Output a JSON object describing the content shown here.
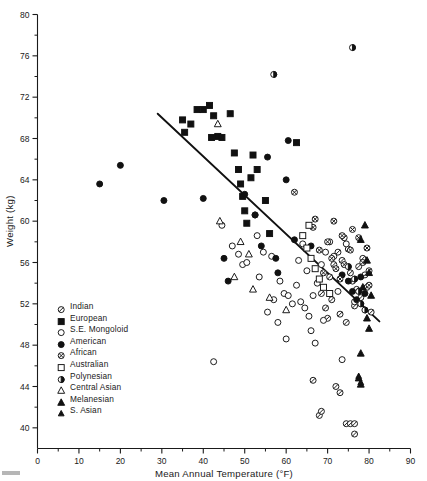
{
  "figure": {
    "title": "",
    "x_axis_title": "Mean Annual Temperature (°F)",
    "y_axis_title": "Weight (kg)"
  },
  "axes": {
    "x_ticks": [
      "0",
      "10",
      "20",
      "30",
      "40",
      "50",
      "60",
      "70",
      "80",
      "90"
    ],
    "y_ticks": [
      "40",
      "44",
      "48",
      "52",
      "56",
      "60",
      "64",
      "68",
      "72",
      "76",
      "80"
    ]
  },
  "legend": {
    "items": [
      {
        "label": "Indian",
        "marker": "circle-slashed"
      },
      {
        "label": "European",
        "marker": "square-filled"
      },
      {
        "label": "S.E. Mongoloid",
        "marker": "circle-open"
      },
      {
        "label": "American",
        "marker": "circle-filled"
      },
      {
        "label": "African",
        "marker": "circle-crossed"
      },
      {
        "label": "Australian",
        "marker": "square-open"
      },
      {
        "label": "Polynesian",
        "marker": "circle-halffilled"
      },
      {
        "label": "Central Asian",
        "marker": "triangle-open"
      },
      {
        "label": "Melanesian",
        "marker": "triangle-filled"
      },
      {
        "label": "S. Asian",
        "marker": "triangle-small-filled"
      }
    ]
  },
  "chart_data": {
    "type": "scatter",
    "title": "",
    "xlabel": "Mean Annual Temperature (°F)",
    "ylabel": "Weight (kg)",
    "xlim": [
      0,
      90
    ],
    "ylim": [
      38,
      80
    ],
    "xticks": [
      0,
      10,
      20,
      30,
      40,
      50,
      60,
      70,
      80,
      90
    ],
    "yticks": [
      40,
      44,
      48,
      52,
      56,
      60,
      64,
      68,
      72,
      76,
      80
    ],
    "x_minor_step": 5,
    "y_minor_step": 2,
    "grid": false,
    "legend_position": "inside-lower-left",
    "trendline": {
      "label": "regression line",
      "x_start": 29.0,
      "y_start": 70.4,
      "x_end": 82.5,
      "y_end": 50.3
    },
    "series": [
      {
        "name": "Indian",
        "marker": "circle-slashed",
        "points": [
          [
            70.5,
            54.6
          ],
          [
            71.5,
            55.8
          ],
          [
            72.5,
            57.0
          ],
          [
            73.5,
            56.2
          ],
          [
            74.0,
            58.4
          ],
          [
            75.0,
            57.3
          ],
          [
            75.5,
            55.0
          ],
          [
            76.0,
            54.2
          ],
          [
            77.0,
            53.4
          ],
          [
            77.5,
            55.6
          ],
          [
            78.5,
            56.4
          ],
          [
            79.0,
            54.8
          ],
          [
            68.5,
            53.0
          ],
          [
            69.5,
            51.6
          ],
          [
            70.0,
            50.6
          ],
          [
            71.0,
            52.4
          ],
          [
            73.0,
            51.0
          ],
          [
            74.5,
            50.2
          ],
          [
            76.5,
            51.8
          ],
          [
            78.0,
            52.6
          ],
          [
            79.5,
            53.6
          ],
          [
            80.0,
            55.2
          ],
          [
            68.0,
            41.2
          ],
          [
            68.5,
            41.6
          ],
          [
            74.5,
            40.4
          ],
          [
            75.5,
            40.4
          ],
          [
            76.5,
            40.4
          ],
          [
            76.5,
            39.4
          ],
          [
            72.0,
            44.0
          ],
          [
            73.0,
            43.4
          ],
          [
            80.5,
            51.2
          ],
          [
            66.5,
            44.6
          ]
        ]
      },
      {
        "name": "European",
        "marker": "square-filled",
        "points": [
          [
            35.0,
            69.8
          ],
          [
            35.5,
            68.6
          ],
          [
            38.5,
            70.8
          ],
          [
            40.0,
            70.8
          ],
          [
            41.5,
            71.2
          ],
          [
            42.5,
            70.2
          ],
          [
            43.5,
            68.2
          ],
          [
            37.0,
            69.4
          ],
          [
            42.0,
            68.1
          ],
          [
            44.5,
            68.1
          ],
          [
            46.5,
            70.4
          ],
          [
            47.5,
            66.6
          ],
          [
            48.5,
            65.0
          ],
          [
            49.0,
            63.6
          ],
          [
            49.5,
            62.4
          ],
          [
            50.0,
            61.0
          ],
          [
            51.5,
            64.2
          ],
          [
            52.0,
            66.4
          ],
          [
            53.0,
            65.0
          ],
          [
            55.0,
            62.0
          ],
          [
            56.0,
            58.8
          ],
          [
            62.5,
            67.6
          ],
          [
            50.5,
            59.8
          ]
        ]
      },
      {
        "name": "S.E. Mongoloid",
        "marker": "circle-open",
        "points": [
          [
            44.5,
            59.6
          ],
          [
            47.0,
            57.6
          ],
          [
            48.5,
            56.8
          ],
          [
            49.5,
            55.8
          ],
          [
            50.5,
            56.0
          ],
          [
            53.0,
            58.6
          ],
          [
            54.5,
            57.0
          ],
          [
            56.5,
            56.6
          ],
          [
            58.5,
            54.2
          ],
          [
            59.5,
            53.0
          ],
          [
            60.5,
            52.8
          ],
          [
            61.5,
            52.0
          ],
          [
            62.5,
            53.8
          ],
          [
            63.5,
            52.2
          ],
          [
            64.5,
            51.6
          ],
          [
            65.5,
            50.8
          ],
          [
            66.5,
            52.8
          ],
          [
            67.5,
            54.0
          ],
          [
            68.5,
            55.8
          ],
          [
            69.5,
            57.0
          ],
          [
            70.5,
            58.0
          ],
          [
            71.5,
            56.6
          ],
          [
            72.5,
            53.2
          ],
          [
            66.0,
            49.4
          ],
          [
            67.0,
            48.2
          ],
          [
            69.0,
            50.4
          ],
          [
            55.5,
            51.2
          ],
          [
            57.0,
            52.4
          ],
          [
            42.5,
            46.4
          ],
          [
            53.5,
            54.6
          ],
          [
            63.0,
            56.2
          ],
          [
            64.0,
            57.8
          ],
          [
            74.5,
            57.8
          ],
          [
            76.5,
            52.2
          ],
          [
            58.0,
            50.2
          ],
          [
            60.0,
            48.6
          ],
          [
            52.5,
            60.6
          ],
          [
            65.0,
            55.2
          ],
          [
            73.5,
            46.6
          ]
        ]
      },
      {
        "name": "American",
        "marker": "circle-filled",
        "points": [
          [
            15.0,
            63.6
          ],
          [
            20.0,
            65.4
          ],
          [
            30.5,
            62.0
          ],
          [
            40.0,
            62.2
          ],
          [
            45.0,
            56.4
          ],
          [
            46.0,
            54.2
          ],
          [
            50.0,
            62.6
          ],
          [
            52.5,
            60.6
          ],
          [
            55.5,
            66.2
          ],
          [
            57.5,
            56.4
          ],
          [
            60.0,
            64.0
          ],
          [
            60.5,
            67.8
          ],
          [
            62.0,
            58.2
          ],
          [
            66.0,
            57.6
          ],
          [
            73.5,
            54.8
          ],
          [
            75.0,
            54.2
          ],
          [
            76.0,
            53.2
          ],
          [
            77.0,
            52.4
          ],
          [
            78.0,
            54.6
          ],
          [
            79.0,
            53.0
          ],
          [
            54.0,
            57.6
          ],
          [
            58.0,
            55.0
          ]
        ]
      },
      {
        "name": "African",
        "marker": "circle-crossed",
        "points": [
          [
            62.0,
            62.8
          ],
          [
            66.5,
            59.4
          ],
          [
            70.0,
            58.0
          ],
          [
            71.0,
            56.4
          ],
          [
            72.0,
            55.4
          ],
          [
            73.0,
            54.4
          ],
          [
            74.0,
            55.8
          ],
          [
            75.5,
            57.2
          ],
          [
            77.5,
            58.4
          ],
          [
            78.5,
            56.0
          ],
          [
            80.0,
            53.8
          ],
          [
            68.0,
            57.2
          ],
          [
            69.0,
            55.0
          ],
          [
            76.0,
            59.2
          ],
          [
            79.5,
            57.4
          ],
          [
            67.0,
            60.2
          ],
          [
            71.5,
            60.0
          ],
          [
            73.5,
            58.6
          ]
        ]
      },
      {
        "name": "Australian",
        "marker": "square-open",
        "points": [
          [
            64.0,
            58.6
          ],
          [
            65.0,
            57.4
          ],
          [
            66.0,
            56.4
          ],
          [
            67.0,
            55.4
          ],
          [
            68.0,
            54.4
          ],
          [
            69.0,
            53.6
          ],
          [
            65.5,
            59.6
          ],
          [
            70.5,
            53.0
          ]
        ]
      },
      {
        "name": "Polynesian",
        "marker": "circle-halffilled",
        "points": [
          [
            76.0,
            76.8
          ],
          [
            57.0,
            74.2
          ],
          [
            75.0,
            55.6
          ],
          [
            76.5,
            54.4
          ],
          [
            77.5,
            53.2
          ],
          [
            78.0,
            52.0
          ],
          [
            79.0,
            51.4
          ]
        ]
      },
      {
        "name": "Central Asian",
        "marker": "triangle-open",
        "points": [
          [
            44.0,
            60.0
          ],
          [
            49.0,
            58.0
          ],
          [
            51.0,
            56.8
          ],
          [
            47.5,
            54.6
          ],
          [
            52.0,
            53.4
          ],
          [
            56.0,
            52.6
          ],
          [
            60.0,
            51.4
          ],
          [
            43.5,
            69.4
          ]
        ]
      },
      {
        "name": "Melanesian",
        "marker": "triangle-filled",
        "points": [
          [
            79.0,
            59.6
          ],
          [
            78.0,
            58.2
          ],
          [
            79.5,
            56.2
          ],
          [
            80.0,
            55.0
          ],
          [
            78.5,
            53.6
          ],
          [
            80.5,
            52.8
          ],
          [
            79.5,
            50.6
          ],
          [
            80.0,
            49.6
          ],
          [
            78.0,
            47.2
          ],
          [
            77.5,
            44.8
          ],
          [
            78.0,
            44.2
          ]
        ]
      },
      {
        "name": "S. Asian",
        "marker": "triangle-small-filled",
        "points": [
          [
            77.5,
            45.0
          ],
          [
            78.0,
            44.4
          ]
        ]
      }
    ]
  }
}
